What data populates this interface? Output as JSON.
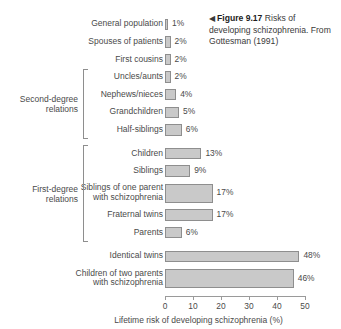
{
  "caption": {
    "arrow_icon": "left-triangle-icon",
    "arrow_glyph": "◀",
    "figure_number": "Figure 9.17",
    "text": " Risks of developing schizophrenia. From Gottesman (1991)"
  },
  "chart_data": {
    "type": "bar",
    "orientation": "horizontal",
    "title": "",
    "xlabel": "Lifetime risk of developing schizophrenia (%)",
    "ylabel": "",
    "xlim": [
      0,
      50
    ],
    "xticks": [
      "0",
      "10",
      "20",
      "30",
      "40",
      "50"
    ],
    "grid": false,
    "legend": "none",
    "bar_color": "#c9c9c9",
    "bar_border_color": "#8e8e8e",
    "value_suffix": "%",
    "categories": [
      "General population",
      "Spouses of patients",
      "First cousins",
      "Uncles/aunts",
      "Nephews/nieces",
      "Grandchildren",
      "Half-siblings",
      "Children",
      "Siblings",
      "Siblings of one parent\nwith schizophrenia",
      "Fraternal twins",
      "Parents",
      "Identical twins",
      "Children of two parents\nwith schizophrenia"
    ],
    "values": [
      1,
      2,
      2,
      2,
      4,
      5,
      6,
      13,
      9,
      17,
      17,
      6,
      48,
      46
    ],
    "value_labels": [
      "1%",
      "2%",
      "2%",
      "2%",
      "4%",
      "5%",
      "6%",
      "13%",
      "9%",
      "17%",
      "17%",
      "6%",
      "48%",
      "46%"
    ],
    "groups": [
      {
        "label": "Second-degree\nrelations",
        "from_index": 3,
        "to_index": 6
      },
      {
        "label": "First-degree\nrelations",
        "from_index": 7,
        "to_index": 11
      }
    ]
  }
}
